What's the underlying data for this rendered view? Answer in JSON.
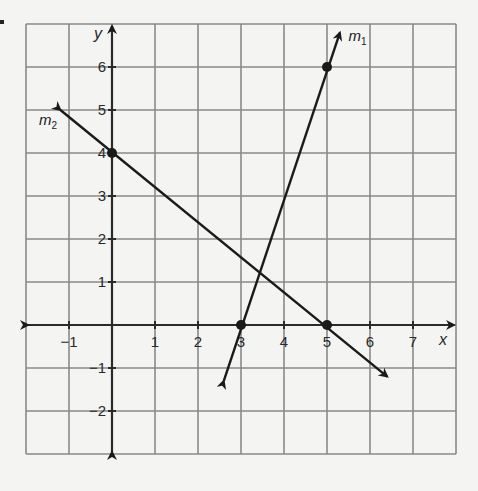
{
  "chart_data": {
    "type": "line",
    "title": "",
    "xlabel": "x",
    "ylabel": "y",
    "xlim": [
      -2,
      8
    ],
    "ylim": [
      -3,
      7
    ],
    "grid": true,
    "x_ticks": [
      -1,
      1,
      2,
      3,
      4,
      5,
      6,
      7
    ],
    "y_ticks": [
      -2,
      -1,
      1,
      2,
      3,
      4,
      5,
      6
    ],
    "x_tick_labels": [
      "−1",
      "1",
      "2",
      "3",
      "4",
      "5",
      "6",
      "7"
    ],
    "y_tick_labels": [
      "−2",
      "−1",
      "1",
      "2",
      "3",
      "4",
      "5",
      "6"
    ],
    "series": [
      {
        "name": "m1",
        "label_main": "m",
        "label_sub": "1",
        "points": [
          [
            3,
            0
          ],
          [
            5,
            6
          ]
        ],
        "slope": 3,
        "arrow_ends": [
          [
            2.6,
            -1.3
          ],
          [
            5.3,
            6.8
          ]
        ],
        "color": "#1a1a1a"
      },
      {
        "name": "m2",
        "label_main": "m",
        "label_sub": "2",
        "points": [
          [
            0,
            4
          ],
          [
            5,
            0
          ]
        ],
        "slope": -0.8,
        "arrow_ends": [
          [
            -1.2,
            5.0
          ],
          [
            6.4,
            -1.2
          ]
        ],
        "color": "#1a1a1a"
      }
    ],
    "legend": "none (inline labels m1, m2)"
  },
  "labels": {
    "x_axis": "x",
    "y_axis": "y",
    "m1_main": "m",
    "m1_sub": "1",
    "m2_main": "m",
    "m2_sub": "2"
  },
  "colors": {
    "background": "#f4f4f2",
    "grid": "#8a8a8a",
    "axis": "#2a2a2a",
    "line": "#1a1a1a"
  }
}
